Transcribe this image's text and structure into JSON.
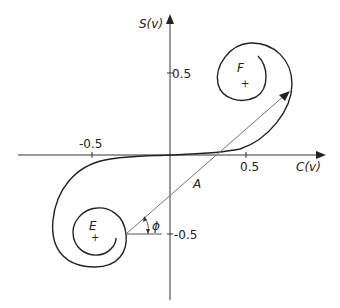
{
  "diagram": {
    "axes": {
      "x_label": "C(v)",
      "y_label": "S(v)",
      "x_ticks": [
        "-0.5",
        "0.5"
      ],
      "y_ticks": [
        "0.5",
        "-0.5"
      ]
    },
    "points": {
      "E": "E",
      "F": "F"
    },
    "phasor_label": "A",
    "angle_label": "ϕ",
    "colors": {
      "curve": "#222222",
      "axis": "#333333",
      "phasor": "#777777"
    }
  }
}
